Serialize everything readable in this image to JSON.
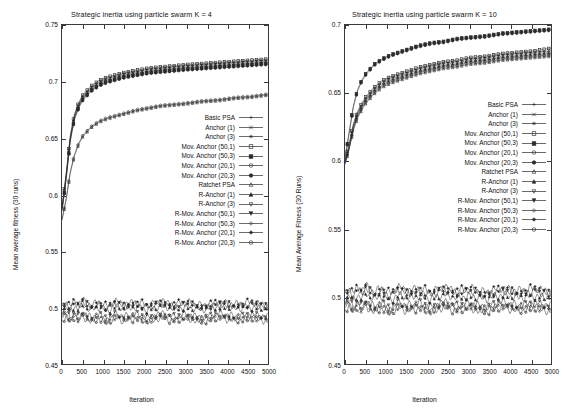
{
  "figure": {
    "width": 566,
    "height": 419,
    "background": "#ffffff",
    "line_color": "#2b2b2b",
    "axis_color": "#3a3a3a"
  },
  "panels": [
    {
      "id": "left",
      "title": "Strategic inertia using particle swarm K = 4",
      "xlabel": "Iteration",
      "ylabel": "Mean average fitness (30 runs)",
      "yticks": [
        "0.45",
        "0.5",
        "0.55",
        "0.6",
        "0.65",
        "0.7",
        "0.75"
      ],
      "ytick_values": [
        0.45,
        0.5,
        0.55,
        0.6,
        0.65,
        0.7,
        0.75
      ],
      "xticks": [
        "0",
        "500",
        "1000",
        "1500",
        "2000",
        "2500",
        "3000",
        "3500",
        "4000",
        "4500",
        "5000"
      ],
      "xtick_values": [
        0,
        500,
        1000,
        1500,
        2000,
        2500,
        3000,
        3500,
        4000,
        4500,
        5000
      ]
    },
    {
      "id": "right",
      "title": "Strategic inertia using particle swarm K = 10",
      "xlabel": "Iteration",
      "ylabel": "Mean Average Fitness (30 Runs)",
      "yticks": [
        "0.45",
        "0.5",
        "0.55",
        "0.6",
        "0.65",
        "0.7"
      ],
      "ytick_values": [
        0.45,
        0.5,
        0.55,
        0.6,
        0.65,
        0.7
      ],
      "xticks": [
        "0",
        "500",
        "1000",
        "1500",
        "2000",
        "2500",
        "3000",
        "3500",
        "4000",
        "4500",
        "5000"
      ],
      "xtick_values": [
        0,
        500,
        1000,
        1500,
        2000,
        2500,
        3000,
        3500,
        4000,
        4500,
        5000
      ]
    }
  ],
  "legend": {
    "entries": [
      {
        "label": "Basic PSA",
        "marker": "plus"
      },
      {
        "label": "Anchor (1)",
        "marker": "cross"
      },
      {
        "label": "Anchor (3)",
        "marker": "star"
      },
      {
        "label": "Mov. Anchor (50,1)",
        "marker": "open-square"
      },
      {
        "label": "Mov. Anchor (50,3)",
        "marker": "filled-square"
      },
      {
        "label": "Mov. Anchor (20,1)",
        "marker": "open-circle"
      },
      {
        "label": "Mov. Anchor (20,3)",
        "marker": "filled-circle"
      },
      {
        "label": "Ratchet PSA",
        "marker": "open-triangle"
      },
      {
        "label": "R-Anchor (1)",
        "marker": "filled-triangle"
      },
      {
        "label": "R-Anchor (3)",
        "marker": "open-down-triangle"
      },
      {
        "label": "R-Mov. Anchor (50,1)",
        "marker": "filled-down-triangle"
      },
      {
        "label": "R-Mov. Anchor (50,3)",
        "marker": "open-diamond"
      },
      {
        "label": "R-Mov. Anchor (20,1)",
        "marker": "filled-diamond"
      },
      {
        "label": "R-Mov. Anchor (20,3)",
        "marker": "open-circle"
      }
    ]
  },
  "chart_data": [
    {
      "type": "line",
      "panel": "left",
      "title": "Strategic inertia using particle swarm K = 4",
      "xlabel": "Iteration",
      "ylabel": "Mean average fitness (30 runs)",
      "xlim": [
        0,
        5000
      ],
      "ylim": [
        0.45,
        0.75
      ],
      "grid": false,
      "legend_position": "center-right inside axes",
      "x": [
        0,
        100,
        200,
        300,
        400,
        500,
        700,
        900,
        1100,
        1300,
        1500,
        1800,
        2100,
        2400,
        2700,
        3000,
        3400,
        3800,
        4200,
        4600,
        5000
      ],
      "series": [
        {
          "name": "Basic PSA",
          "marker": "plus",
          "group": "upper",
          "values": [
            0.588,
            0.617,
            0.651,
            0.67,
            0.68,
            0.687,
            0.695,
            0.7,
            0.703,
            0.705,
            0.707,
            0.709,
            0.711,
            0.712,
            0.713,
            0.714,
            0.715,
            0.716,
            0.717,
            0.718,
            0.719
          ]
        },
        {
          "name": "Anchor (1)",
          "marker": "cross",
          "group": "upper",
          "values": [
            0.588,
            0.616,
            0.65,
            0.669,
            0.679,
            0.686,
            0.694,
            0.699,
            0.702,
            0.704,
            0.706,
            0.708,
            0.71,
            0.711,
            0.712,
            0.713,
            0.714,
            0.715,
            0.716,
            0.717,
            0.718
          ]
        },
        {
          "name": "Anchor (3)",
          "marker": "star",
          "group": "upper",
          "values": [
            0.587,
            0.615,
            0.649,
            0.668,
            0.678,
            0.685,
            0.693,
            0.698,
            0.701,
            0.703,
            0.705,
            0.707,
            0.709,
            0.71,
            0.711,
            0.712,
            0.713,
            0.714,
            0.715,
            0.716,
            0.717
          ]
        },
        {
          "name": "Mov. Anchor (50,1)",
          "marker": "open-square",
          "group": "upper",
          "values": [
            0.589,
            0.618,
            0.652,
            0.671,
            0.681,
            0.688,
            0.696,
            0.701,
            0.704,
            0.706,
            0.708,
            0.71,
            0.712,
            0.713,
            0.714,
            0.715,
            0.716,
            0.717,
            0.718,
            0.719,
            0.72
          ]
        },
        {
          "name": "Mov. Anchor (50,3)",
          "marker": "filled-square",
          "group": "upper",
          "values": [
            0.586,
            0.614,
            0.648,
            0.667,
            0.677,
            0.684,
            0.692,
            0.697,
            0.7,
            0.702,
            0.704,
            0.706,
            0.708,
            0.709,
            0.71,
            0.711,
            0.712,
            0.713,
            0.714,
            0.715,
            0.716
          ]
        },
        {
          "name": "Mov. Anchor (20,1)",
          "marker": "open-circle",
          "group": "lower-rise",
          "values": [
            0.578,
            0.596,
            0.62,
            0.635,
            0.645,
            0.652,
            0.66,
            0.665,
            0.668,
            0.67,
            0.672,
            0.675,
            0.677,
            0.679,
            0.68,
            0.681,
            0.683,
            0.684,
            0.686,
            0.687,
            0.689
          ]
        },
        {
          "name": "Mov. Anchor (20,3)",
          "marker": "filled-circle",
          "group": "upper",
          "values": [
            0.585,
            0.613,
            0.647,
            0.666,
            0.676,
            0.683,
            0.691,
            0.696,
            0.699,
            0.701,
            0.703,
            0.705,
            0.707,
            0.708,
            0.709,
            0.71,
            0.711,
            0.712,
            0.713,
            0.714,
            0.715
          ]
        },
        {
          "name": "Ratchet PSA",
          "marker": "open-triangle",
          "group": "lower-rise",
          "values": [
            0.577,
            0.595,
            0.619,
            0.634,
            0.644,
            0.651,
            0.659,
            0.664,
            0.667,
            0.669,
            0.671,
            0.674,
            0.676,
            0.678,
            0.679,
            0.68,
            0.682,
            0.683,
            0.685,
            0.686,
            0.688
          ]
        },
        {
          "name": "R-Anchor (1)",
          "marker": "filled-triangle",
          "group": "flat",
          "values": [
            0.498,
            0.5,
            0.497,
            0.501,
            0.499,
            0.502,
            0.498,
            0.5,
            0.497,
            0.501,
            0.499,
            0.5,
            0.498,
            0.501,
            0.499,
            0.5,
            0.498,
            0.501,
            0.499,
            0.5,
            0.499
          ]
        },
        {
          "name": "R-Anchor (3)",
          "marker": "open-down-triangle",
          "group": "flat",
          "values": [
            0.493,
            0.496,
            0.491,
            0.495,
            0.492,
            0.496,
            0.491,
            0.494,
            0.49,
            0.495,
            0.492,
            0.494,
            0.491,
            0.495,
            0.492,
            0.494,
            0.491,
            0.495,
            0.492,
            0.494,
            0.492
          ]
        },
        {
          "name": "R-Mov. Anchor (50,1)",
          "marker": "filled-down-triangle",
          "group": "flat",
          "values": [
            0.5,
            0.503,
            0.499,
            0.504,
            0.501,
            0.505,
            0.5,
            0.503,
            0.499,
            0.504,
            0.501,
            0.503,
            0.5,
            0.504,
            0.501,
            0.503,
            0.5,
            0.503,
            0.501,
            0.503,
            0.5
          ]
        },
        {
          "name": "R-Mov. Anchor (50,3)",
          "marker": "open-diamond",
          "group": "flat",
          "values": [
            0.491,
            0.494,
            0.489,
            0.493,
            0.49,
            0.494,
            0.489,
            0.492,
            0.488,
            0.493,
            0.49,
            0.492,
            0.489,
            0.493,
            0.49,
            0.492,
            0.489,
            0.493,
            0.49,
            0.492,
            0.49
          ]
        },
        {
          "name": "R-Mov. Anchor (20,1)",
          "marker": "filled-diamond",
          "group": "flat",
          "values": [
            0.502,
            0.505,
            0.501,
            0.506,
            0.503,
            0.507,
            0.502,
            0.505,
            0.501,
            0.506,
            0.503,
            0.505,
            0.502,
            0.506,
            0.503,
            0.505,
            0.502,
            0.505,
            0.503,
            0.505,
            0.502
          ]
        },
        {
          "name": "R-Mov. Anchor (20,3)",
          "marker": "open-circle",
          "group": "flat",
          "values": [
            0.489,
            0.492,
            0.487,
            0.491,
            0.488,
            0.492,
            0.487,
            0.49,
            0.486,
            0.491,
            0.488,
            0.49,
            0.487,
            0.491,
            0.488,
            0.49,
            0.487,
            0.491,
            0.488,
            0.49,
            0.488
          ]
        }
      ]
    },
    {
      "type": "line",
      "panel": "right",
      "title": "Strategic inertia using particle swarm K = 10",
      "xlabel": "Iteration",
      "ylabel": "Mean Average Fitness (30 Runs)",
      "xlim": [
        0,
        5000
      ],
      "ylim": [
        0.45,
        0.7
      ],
      "grid": false,
      "legend_position": "center-right inside axes",
      "x": [
        0,
        100,
        200,
        300,
        400,
        500,
        700,
        900,
        1100,
        1300,
        1500,
        1800,
        2100,
        2400,
        2700,
        3000,
        3400,
        3800,
        4200,
        4600,
        5000
      ],
      "series": [
        {
          "name": "Basic PSA",
          "marker": "plus",
          "group": "mid",
          "values": [
            0.599,
            0.611,
            0.626,
            0.635,
            0.641,
            0.646,
            0.653,
            0.658,
            0.661,
            0.663,
            0.665,
            0.668,
            0.67,
            0.672,
            0.673,
            0.675,
            0.676,
            0.678,
            0.679,
            0.68,
            0.681
          ]
        },
        {
          "name": "Anchor (1)",
          "marker": "cross",
          "group": "mid",
          "values": [
            0.599,
            0.61,
            0.625,
            0.634,
            0.64,
            0.645,
            0.652,
            0.657,
            0.66,
            0.662,
            0.664,
            0.667,
            0.669,
            0.671,
            0.672,
            0.674,
            0.675,
            0.677,
            0.678,
            0.679,
            0.68
          ]
        },
        {
          "name": "Anchor (3)",
          "marker": "star",
          "group": "mid",
          "values": [
            0.598,
            0.609,
            0.624,
            0.633,
            0.639,
            0.644,
            0.651,
            0.656,
            0.659,
            0.661,
            0.663,
            0.666,
            0.668,
            0.67,
            0.671,
            0.673,
            0.674,
            0.676,
            0.677,
            0.678,
            0.679
          ]
        },
        {
          "name": "Mov. Anchor (50,1)",
          "marker": "open-square",
          "group": "mid",
          "values": [
            0.6,
            0.612,
            0.627,
            0.636,
            0.642,
            0.647,
            0.654,
            0.659,
            0.662,
            0.664,
            0.666,
            0.669,
            0.671,
            0.673,
            0.674,
            0.676,
            0.677,
            0.679,
            0.68,
            0.681,
            0.683
          ]
        },
        {
          "name": "Mov. Anchor (50,3)",
          "marker": "filled-square",
          "group": "top",
          "values": [
            0.602,
            0.621,
            0.64,
            0.652,
            0.659,
            0.664,
            0.671,
            0.675,
            0.678,
            0.68,
            0.682,
            0.685,
            0.687,
            0.688,
            0.69,
            0.691,
            0.692,
            0.694,
            0.695,
            0.696,
            0.697
          ]
        },
        {
          "name": "Mov. Anchor (20,1)",
          "marker": "open-circle",
          "group": "mid",
          "values": [
            0.598,
            0.609,
            0.623,
            0.632,
            0.638,
            0.643,
            0.65,
            0.655,
            0.658,
            0.66,
            0.662,
            0.665,
            0.667,
            0.669,
            0.67,
            0.672,
            0.673,
            0.675,
            0.676,
            0.677,
            0.678
          ]
        },
        {
          "name": "Mov. Anchor (20,3)",
          "marker": "filled-circle",
          "group": "top",
          "values": [
            0.601,
            0.62,
            0.639,
            0.651,
            0.658,
            0.663,
            0.67,
            0.674,
            0.677,
            0.679,
            0.681,
            0.684,
            0.686,
            0.687,
            0.689,
            0.69,
            0.691,
            0.693,
            0.694,
            0.695,
            0.696
          ]
        },
        {
          "name": "Ratchet PSA",
          "marker": "open-triangle",
          "group": "mid",
          "values": [
            0.597,
            0.608,
            0.622,
            0.631,
            0.637,
            0.642,
            0.649,
            0.654,
            0.657,
            0.659,
            0.661,
            0.664,
            0.666,
            0.668,
            0.669,
            0.671,
            0.672,
            0.674,
            0.675,
            0.676,
            0.677
          ]
        },
        {
          "name": "R-Anchor (1)",
          "marker": "filled-triangle",
          "group": "flat",
          "values": [
            0.498,
            0.5,
            0.497,
            0.501,
            0.499,
            0.502,
            0.498,
            0.5,
            0.497,
            0.501,
            0.499,
            0.5,
            0.498,
            0.501,
            0.499,
            0.5,
            0.498,
            0.501,
            0.499,
            0.5,
            0.499
          ]
        },
        {
          "name": "R-Anchor (3)",
          "marker": "open-down-triangle",
          "group": "flat",
          "values": [
            0.494,
            0.497,
            0.492,
            0.496,
            0.493,
            0.497,
            0.492,
            0.495,
            0.491,
            0.496,
            0.493,
            0.495,
            0.492,
            0.496,
            0.493,
            0.495,
            0.492,
            0.496,
            0.493,
            0.495,
            0.493
          ]
        },
        {
          "name": "R-Mov. Anchor (50,1)",
          "marker": "filled-down-triangle",
          "group": "flat",
          "values": [
            0.501,
            0.504,
            0.5,
            0.505,
            0.502,
            0.506,
            0.501,
            0.504,
            0.5,
            0.505,
            0.502,
            0.504,
            0.501,
            0.505,
            0.502,
            0.504,
            0.501,
            0.504,
            0.502,
            0.504,
            0.501
          ]
        },
        {
          "name": "R-Mov. Anchor (50,3)",
          "marker": "open-diamond",
          "group": "flat",
          "values": [
            0.492,
            0.495,
            0.49,
            0.494,
            0.491,
            0.495,
            0.49,
            0.493,
            0.489,
            0.494,
            0.491,
            0.493,
            0.49,
            0.494,
            0.491,
            0.493,
            0.49,
            0.494,
            0.491,
            0.493,
            0.491
          ]
        },
        {
          "name": "R-Mov. Anchor (20,1)",
          "marker": "filled-diamond",
          "group": "flat",
          "values": [
            0.503,
            0.506,
            0.502,
            0.507,
            0.504,
            0.508,
            0.503,
            0.506,
            0.502,
            0.507,
            0.504,
            0.506,
            0.503,
            0.507,
            0.504,
            0.506,
            0.503,
            0.506,
            0.504,
            0.506,
            0.503
          ]
        },
        {
          "name": "R-Mov. Anchor (20,3)",
          "marker": "open-circle",
          "group": "flat",
          "values": [
            0.49,
            0.493,
            0.488,
            0.492,
            0.489,
            0.493,
            0.488,
            0.491,
            0.487,
            0.492,
            0.489,
            0.491,
            0.488,
            0.492,
            0.489,
            0.491,
            0.488,
            0.492,
            0.489,
            0.491,
            0.489
          ]
        }
      ]
    }
  ]
}
